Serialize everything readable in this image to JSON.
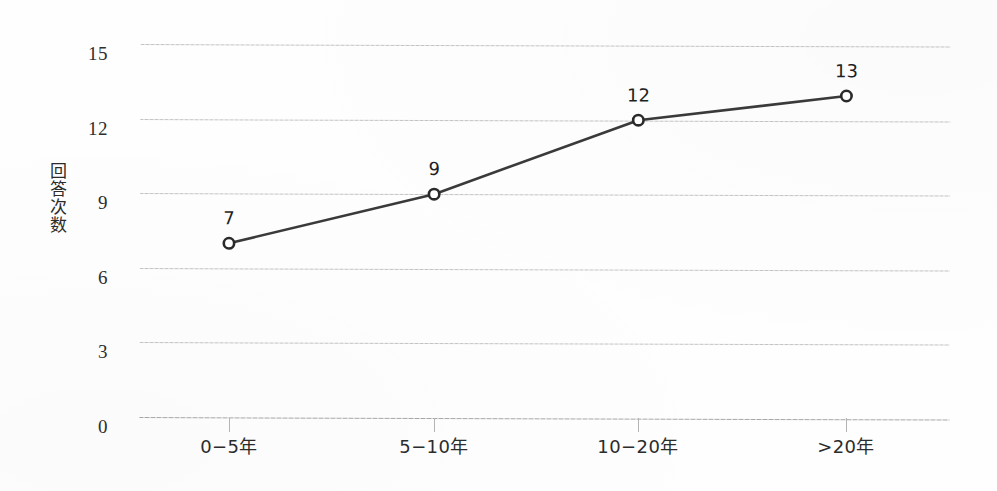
{
  "chart_data": {
    "type": "line",
    "title": "",
    "xlabel": "",
    "ylabel": "回答次数",
    "categories": [
      "0−5年",
      "5−10年",
      "10−20年",
      ">20年"
    ],
    "values": [
      7,
      9,
      12,
      13
    ],
    "point_labels": [
      "7",
      "9",
      "12",
      "13"
    ],
    "ylim": [
      0,
      15
    ],
    "yticks": [
      0,
      3,
      6,
      9,
      12,
      15
    ],
    "ytick_labels": [
      "0",
      "3",
      "6",
      "9",
      "12",
      "15"
    ],
    "grid": "horizontal-dotted",
    "legend": "none",
    "series": [
      {
        "name": "回答次数",
        "values": [
          7,
          9,
          12,
          13
        ],
        "marker": "open-circle",
        "line_color": "#3a3a3a",
        "marker_fill": "#ffffff",
        "marker_stroke": "#2a2a2a"
      }
    ]
  },
  "style": {
    "background": "#fefefe",
    "gridline_color": "#b9b9b9",
    "axis_text_color": "#2c2c2c",
    "line_color": "#3a3a3a"
  }
}
